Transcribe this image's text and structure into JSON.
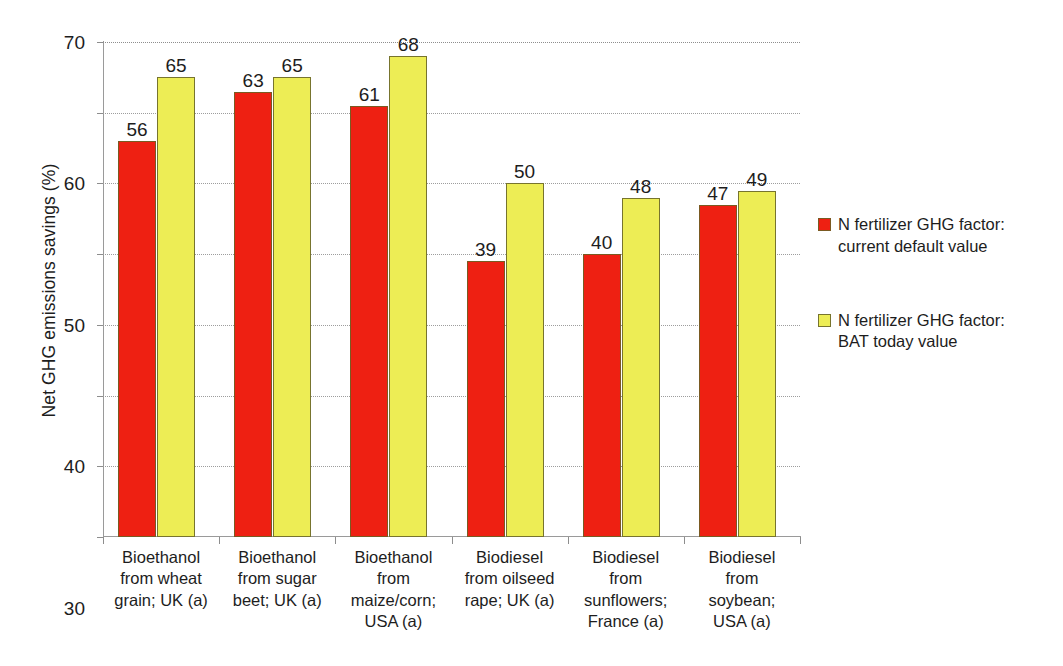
{
  "chart_data": {
    "type": "bar",
    "title": "",
    "xlabel": "",
    "ylabel": "Net GHG emissions savings (%)",
    "ylim": [
      0,
      70
    ],
    "yticks": [
      0,
      10,
      20,
      30,
      40,
      50,
      60,
      70
    ],
    "grid": true,
    "legend_position": "right",
    "categories": [
      "Bioethanol from wheat grain; UK (a)",
      "Bioethanol from sugar beet; UK (a)",
      "Bioethanol from maize/corn; USA (a)",
      "Biodiesel from oilseed rape; UK (a)",
      "Biodiesel from sunflowers; France (a)",
      "Biodiesel from soybean; USA (a)"
    ],
    "category_lines": [
      [
        "Bioethanol",
        "from wheat",
        "grain; UK (a)"
      ],
      [
        "Bioethanol",
        "from sugar",
        "beet; UK (a)"
      ],
      [
        "Bioethanol",
        "from",
        "maize/corn;",
        "USA (a)"
      ],
      [
        "Biodiesel",
        "from oilseed",
        "rape; UK (a)"
      ],
      [
        "Biodiesel",
        "from",
        "sunflowers;",
        "France (a)"
      ],
      [
        "Biodiesel",
        "from",
        "soybean;",
        "USA (a)"
      ]
    ],
    "series": [
      {
        "name": "N fertilizer GHG factor: current default value",
        "name_lines": [
          "N fertilizer GHG factor:",
          "current default value"
        ],
        "color": "#ee2012",
        "values": [
          56,
          63,
          61,
          39,
          40,
          47
        ]
      },
      {
        "name": "N fertilizer GHG factor: BAT today value",
        "name_lines": [
          "N fertilizer GHG factor:",
          "BAT today value"
        ],
        "color": "#eded55",
        "values": [
          65,
          65,
          68,
          50,
          48,
          49
        ]
      }
    ]
  }
}
